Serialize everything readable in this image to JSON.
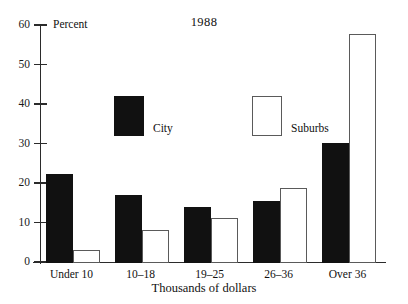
{
  "chart_data": {
    "type": "bar",
    "title": "1988",
    "xlabel": "Thousands of dollars",
    "ylabel": "Percent",
    "ylim": [
      0,
      60
    ],
    "yticks": [
      0,
      10,
      20,
      30,
      40,
      50,
      60
    ],
    "grid": false,
    "legend_position": "upper-center-left",
    "categories": [
      "Under 10",
      "10–18",
      "19–25",
      "26–36",
      "Over 36"
    ],
    "series": [
      {
        "name": "City",
        "color": "#111111",
        "values": [
          22.5,
          17.3,
          14.2,
          15.6,
          30.5
        ]
      },
      {
        "name": "Suburbs",
        "color": "#ffffff",
        "values": [
          3.4,
          8.3,
          11.4,
          19.0,
          58.0
        ]
      }
    ]
  },
  "axis": {
    "y_title": "Percent",
    "x_title": "Thousands of dollars",
    "tick_labels": [
      "60",
      "50",
      "40",
      "30",
      "20",
      "10",
      "0"
    ]
  },
  "legend": {
    "city_label": "City",
    "suburbs_label": "Suburbs"
  },
  "title": "1988"
}
